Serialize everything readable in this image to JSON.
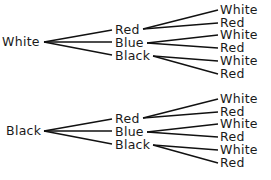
{
  "diagram": {
    "type": "tree",
    "trees": [
      {
        "root": "White",
        "children": [
          {
            "label": "Red",
            "children": [
              "White",
              "Red"
            ]
          },
          {
            "label": "Blue",
            "children": [
              "White",
              "Red"
            ]
          },
          {
            "label": "Black",
            "children": [
              "White",
              "Red"
            ]
          }
        ]
      },
      {
        "root": "Black",
        "children": [
          {
            "label": "Red",
            "children": [
              "White",
              "Red"
            ]
          },
          {
            "label": "Blue",
            "children": [
              "White",
              "Red"
            ]
          },
          {
            "label": "Black",
            "children": [
              "White",
              "Red"
            ]
          }
        ]
      }
    ]
  }
}
